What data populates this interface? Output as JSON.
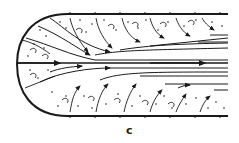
{
  "figure": {
    "panel_label": "c",
    "colors": {
      "ink": "#1a1a1a",
      "background": "#ffffff"
    }
  }
}
